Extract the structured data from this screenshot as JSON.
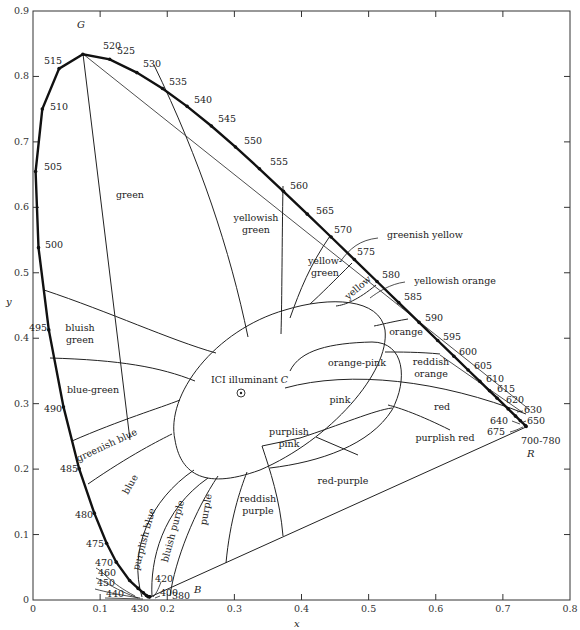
{
  "chart_data": {
    "type": "diagram",
    "xlabel": "x",
    "ylabel": "y",
    "xlim": [
      0,
      0.8
    ],
    "ylim": [
      0,
      0.9
    ],
    "x_ticks": [
      "0",
      "0.1",
      "0.2",
      "0.3",
      "0.4",
      "0.5",
      "0.6",
      "0.7",
      "0.8"
    ],
    "y_ticks": [
      "0",
      "0.1",
      "0.2",
      "0.3",
      "0.4",
      "0.5",
      "0.6",
      "0.7",
      "0.8",
      "0.9"
    ],
    "corner_labels": {
      "G": "G",
      "B": "B",
      "R": "R"
    },
    "illuminant": {
      "label": "ICI illuminant",
      "symbol": "C",
      "x": 0.31,
      "y": 0.316
    },
    "spectral_locus": [
      {
        "nm": "380",
        "x": 0.1741,
        "y": 0.005
      },
      {
        "nm": "400",
        "x": 0.1733,
        "y": 0.0048
      },
      {
        "nm": "420",
        "x": 0.1714,
        "y": 0.0051
      },
      {
        "nm": "430",
        "x": 0.1689,
        "y": 0.0069
      },
      {
        "nm": "440",
        "x": 0.1644,
        "y": 0.0109
      },
      {
        "nm": "450",
        "x": 0.1566,
        "y": 0.0177
      },
      {
        "nm": "460",
        "x": 0.144,
        "y": 0.0297
      },
      {
        "nm": "470",
        "x": 0.1241,
        "y": 0.0578
      },
      {
        "nm": "475",
        "x": 0.1096,
        "y": 0.0868
      },
      {
        "nm": "480",
        "x": 0.0913,
        "y": 0.1327
      },
      {
        "nm": "485",
        "x": 0.0687,
        "y": 0.2007
      },
      {
        "nm": "490",
        "x": 0.0454,
        "y": 0.295
      },
      {
        "nm": "495",
        "x": 0.0235,
        "y": 0.4127
      },
      {
        "nm": "500",
        "x": 0.0082,
        "y": 0.5384
      },
      {
        "nm": "505",
        "x": 0.0039,
        "y": 0.6548
      },
      {
        "nm": "510",
        "x": 0.0139,
        "y": 0.7502
      },
      {
        "nm": "515",
        "x": 0.0389,
        "y": 0.812
      },
      {
        "nm": "520",
        "x": 0.0743,
        "y": 0.8338
      },
      {
        "nm": "525",
        "x": 0.1142,
        "y": 0.8262
      },
      {
        "nm": "530",
        "x": 0.1547,
        "y": 0.8059
      },
      {
        "nm": "535",
        "x": 0.1929,
        "y": 0.7816
      },
      {
        "nm": "540",
        "x": 0.2296,
        "y": 0.7543
      },
      {
        "nm": "545",
        "x": 0.2658,
        "y": 0.7243
      },
      {
        "nm": "550",
        "x": 0.3016,
        "y": 0.6923
      },
      {
        "nm": "555",
        "x": 0.3373,
        "y": 0.6589
      },
      {
        "nm": "560",
        "x": 0.3731,
        "y": 0.6245
      },
      {
        "nm": "565",
        "x": 0.4087,
        "y": 0.5896
      },
      {
        "nm": "570",
        "x": 0.4441,
        "y": 0.5547
      },
      {
        "nm": "575",
        "x": 0.4788,
        "y": 0.5202
      },
      {
        "nm": "580",
        "x": 0.5125,
        "y": 0.4866
      },
      {
        "nm": "585",
        "x": 0.5448,
        "y": 0.4544
      },
      {
        "nm": "590",
        "x": 0.5752,
        "y": 0.4242
      },
      {
        "nm": "595",
        "x": 0.6029,
        "y": 0.3965
      },
      {
        "nm": "600",
        "x": 0.627,
        "y": 0.3725
      },
      {
        "nm": "605",
        "x": 0.6482,
        "y": 0.3514
      },
      {
        "nm": "610",
        "x": 0.6658,
        "y": 0.334
      },
      {
        "nm": "615",
        "x": 0.6801,
        "y": 0.3197
      },
      {
        "nm": "620",
        "x": 0.6915,
        "y": 0.3083
      },
      {
        "nm": "630",
        "x": 0.7079,
        "y": 0.292
      },
      {
        "nm": "640",
        "x": 0.719,
        "y": 0.2809
      },
      {
        "nm": "650",
        "x": 0.726,
        "y": 0.274
      },
      {
        "nm": "675",
        "x": 0.7334,
        "y": 0.2666
      },
      {
        "nm": "700-780",
        "x": 0.7347,
        "y": 0.2653
      }
    ],
    "wavelength_labels": [
      {
        "text": "520",
        "px": 103,
        "py": 49
      },
      {
        "text": "525",
        "px": 117,
        "py": 54
      },
      {
        "text": "530",
        "px": 143,
        "py": 67
      },
      {
        "text": "535",
        "px": 169,
        "py": 85
      },
      {
        "text": "540",
        "px": 194,
        "py": 103
      },
      {
        "text": "545",
        "px": 218,
        "py": 122
      },
      {
        "text": "550",
        "px": 244,
        "py": 144
      },
      {
        "text": "555",
        "px": 270,
        "py": 165
      },
      {
        "text": "560",
        "px": 290,
        "py": 189
      },
      {
        "text": "565",
        "px": 316,
        "py": 214
      },
      {
        "text": "570",
        "px": 334,
        "py": 233
      },
      {
        "text": "575",
        "px": 357,
        "py": 255
      },
      {
        "text": "580",
        "px": 382,
        "py": 278
      },
      {
        "text": "585",
        "px": 404,
        "py": 300
      },
      {
        "text": "590",
        "px": 425,
        "py": 321
      },
      {
        "text": "595",
        "px": 443,
        "py": 340
      },
      {
        "text": "600",
        "px": 459,
        "py": 355
      },
      {
        "text": "605",
        "px": 474,
        "py": 369
      },
      {
        "text": "610",
        "px": 486,
        "py": 382
      },
      {
        "text": "615",
        "px": 497,
        "py": 392
      },
      {
        "text": "620",
        "px": 506,
        "py": 403
      },
      {
        "text": "630",
        "px": 524,
        "py": 413
      },
      {
        "text": "640",
        "px": 490,
        "py": 424
      },
      {
        "text": "650",
        "px": 527,
        "py": 424
      },
      {
        "text": "675",
        "px": 487,
        "py": 435
      },
      {
        "text": "700-780",
        "px": 521,
        "py": 444
      },
      {
        "text": "515",
        "px": 44,
        "py": 64
      },
      {
        "text": "510",
        "px": 50,
        "py": 110
      },
      {
        "text": "505",
        "px": 44,
        "py": 170
      },
      {
        "text": "500",
        "px": 45,
        "py": 248
      },
      {
        "text": "495",
        "px": 29,
        "py": 331
      },
      {
        "text": "490",
        "px": 44,
        "py": 412
      },
      {
        "text": "485",
        "px": 60,
        "py": 472
      },
      {
        "text": "480",
        "px": 75,
        "py": 518
      },
      {
        "text": "475",
        "px": 86,
        "py": 547
      },
      {
        "text": "470",
        "px": 95,
        "py": 566
      },
      {
        "text": "460",
        "px": 98,
        "py": 576
      },
      {
        "text": "450",
        "px": 97,
        "py": 586
      },
      {
        "text": "440",
        "px": 106,
        "py": 597
      },
      {
        "text": "430",
        "px": 131,
        "py": 612
      },
      {
        "text": "420",
        "px": 155,
        "py": 582
      },
      {
        "text": "400",
        "px": 160,
        "py": 596
      },
      {
        "text": "380",
        "px": 172,
        "py": 599
      }
    ],
    "regions": [
      {
        "name": "green",
        "px": 130,
        "py": 198
      },
      {
        "name": "yellowish green",
        "px": 256,
        "py": 221
      },
      {
        "name": "yellow-green",
        "px": 325,
        "py": 264
      },
      {
        "name": "greenish yellow",
        "px": 425,
        "py": 238
      },
      {
        "name": "yellow",
        "px": 360,
        "py": 290
      },
      {
        "name": "yellowish orange",
        "px": 455,
        "py": 284
      },
      {
        "name": "orange",
        "px": 406,
        "py": 335
      },
      {
        "name": "reddish orange",
        "px": 431,
        "py": 365
      },
      {
        "name": "orange-pink",
        "px": 357,
        "py": 366
      },
      {
        "name": "bluish green",
        "px": 80,
        "py": 331
      },
      {
        "name": "blue-green",
        "px": 93,
        "py": 393
      },
      {
        "name": "greenish blue",
        "px": 108,
        "py": 448
      },
      {
        "name": "pink",
        "px": 340,
        "py": 403
      },
      {
        "name": "red",
        "px": 442,
        "py": 410
      },
      {
        "name": "purplish pink",
        "px": 289,
        "py": 435
      },
      {
        "name": "purplish red",
        "px": 445,
        "py": 441
      },
      {
        "name": "red-purple",
        "px": 343,
        "py": 484
      },
      {
        "name": "reddish purple",
        "px": 258,
        "py": 502
      },
      {
        "name": "purple",
        "px": 209,
        "py": 510
      },
      {
        "name": "bluish purple",
        "px": 176,
        "py": 532
      },
      {
        "name": "purplish blue",
        "px": 147,
        "py": 540
      },
      {
        "name": "blue",
        "px": 133,
        "py": 486
      }
    ]
  }
}
